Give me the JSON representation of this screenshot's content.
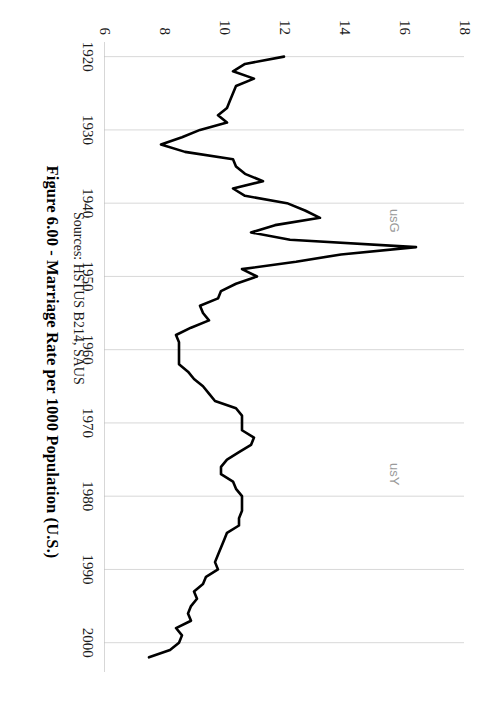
{
  "figure": {
    "title": "Figure 6.00 - Marriage Rate per 1000 Population (U.S.)",
    "sources": "Sources: HSTUS B214, SAUS",
    "watermarks": [
      {
        "text": "usG",
        "x": 0.305,
        "y": 0.175
      },
      {
        "text": "usY",
        "x": 0.655,
        "y": 0.175
      }
    ]
  },
  "chart_data": {
    "type": "line",
    "title": "Figure 6.00 - Marriage Rate per 1000 Population (U.S.)",
    "subtitle": "Sources: HSTUS B214, SAUS",
    "xlabel": "",
    "ylabel": "",
    "xlim": [
      1918,
      2004
    ],
    "ylim": [
      6,
      18
    ],
    "grid": true,
    "grid_axis": "x",
    "legend": "none",
    "rotation_deg": 90,
    "line_color": "#000000",
    "line_width": 2.6,
    "xticks": [
      1920,
      1930,
      1940,
      1950,
      1960,
      1970,
      1980,
      1990,
      2000
    ],
    "yticks": [
      6,
      8,
      10,
      12,
      14,
      16,
      18
    ],
    "ytick_labels": [
      "6",
      "8",
      "10",
      "12",
      "14",
      "16",
      "18"
    ],
    "xtick_labels": [
      "1920",
      "1930",
      "1940",
      "1950",
      "1960",
      "1970",
      "1980",
      "1990",
      "2000"
    ],
    "series": [
      {
        "name": "Marriage rate per 1000 population",
        "x": [
          1920,
          1921,
          1922,
          1923,
          1924,
          1925,
          1926,
          1927,
          1928,
          1929,
          1930,
          1931,
          1932,
          1933,
          1934,
          1935,
          1936,
          1937,
          1938,
          1939,
          1940,
          1941,
          1942,
          1943,
          1944,
          1945,
          1946,
          1947,
          1948,
          1949,
          1950,
          1951,
          1952,
          1953,
          1954,
          1955,
          1956,
          1957,
          1958,
          1959,
          1960,
          1961,
          1962,
          1963,
          1964,
          1965,
          1966,
          1967,
          1968,
          1969,
          1970,
          1971,
          1972,
          1973,
          1974,
          1975,
          1976,
          1977,
          1978,
          1979,
          1980,
          1981,
          1982,
          1983,
          1984,
          1985,
          1986,
          1987,
          1988,
          1989,
          1990,
          1991,
          1992,
          1993,
          1994,
          1995,
          1996,
          1997,
          1998,
          1999,
          2000,
          2001,
          2002
        ],
        "y": [
          12.0,
          10.7,
          10.3,
          11.0,
          10.4,
          10.3,
          10.2,
          10.1,
          9.8,
          10.1,
          9.2,
          8.6,
          7.9,
          8.7,
          10.3,
          10.4,
          10.7,
          11.3,
          10.3,
          10.7,
          12.1,
          12.7,
          13.2,
          11.7,
          10.9,
          12.2,
          16.4,
          13.9,
          12.4,
          10.6,
          11.1,
          10.4,
          9.9,
          9.8,
          9.2,
          9.3,
          9.5,
          8.9,
          8.4,
          8.5,
          8.5,
          8.5,
          8.5,
          8.8,
          9.0,
          9.3,
          9.5,
          9.7,
          10.4,
          10.6,
          10.6,
          10.6,
          11.0,
          10.9,
          10.5,
          10.1,
          9.9,
          9.9,
          10.3,
          10.4,
          10.6,
          10.6,
          10.6,
          10.5,
          10.5,
          10.1,
          10.0,
          9.9,
          9.8,
          9.7,
          9.8,
          9.4,
          9.3,
          9.0,
          9.1,
          8.9,
          8.8,
          8.9,
          8.4,
          8.6,
          8.5,
          8.2,
          7.5
        ]
      }
    ],
    "annotations": [
      {
        "label": "1946 post-war peak",
        "x": 1946,
        "y": 16.4
      },
      {
        "label": "1932 Depression trough",
        "x": 1932,
        "y": 7.9
      }
    ]
  }
}
